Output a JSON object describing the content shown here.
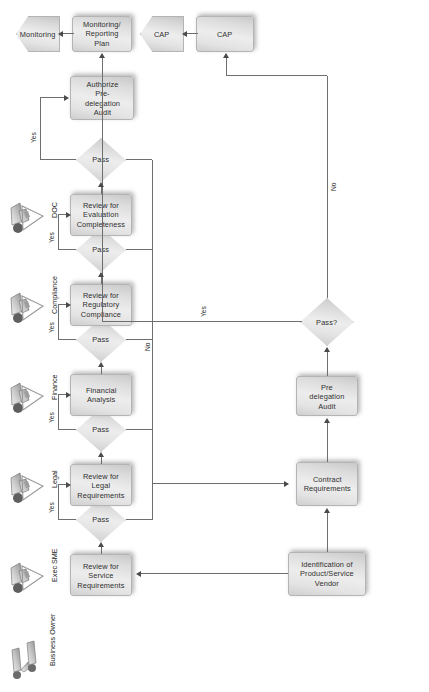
{
  "diagram": {
    "orientation": "rotated-90-ccw",
    "colors": {
      "node_fill": "#e3e3e3",
      "node_border": "#b4b4b4",
      "connector": "#6e6e6e",
      "text": "#2f2f2f",
      "background": "#ffffff"
    }
  },
  "lanes": [
    {
      "id": "business-owner",
      "label": "Business Owner",
      "icon": "two-people-icon"
    },
    {
      "id": "exec-sme",
      "label": "Exec SME",
      "icon": "person-writing-icon"
    },
    {
      "id": "legal",
      "label": "Legal",
      "icon": "person-writing-icon"
    },
    {
      "id": "finance",
      "label": "Finance",
      "icon": "person-writing-icon"
    },
    {
      "id": "compliance",
      "label": "Compliance",
      "icon": "person-writing-icon"
    },
    {
      "id": "doc",
      "label": "DOC",
      "icon": "person-writing-icon"
    }
  ],
  "nodes": [
    {
      "id": "identification",
      "label": "Identification of Product/Service Vendor",
      "shape": "process"
    },
    {
      "id": "contract-req",
      "label": "Contract Requirements",
      "shape": "process"
    },
    {
      "id": "pre-delegation",
      "label": "Pre delegation Audit",
      "shape": "process"
    },
    {
      "id": "pass-final",
      "label": "Pass?",
      "shape": "decision"
    },
    {
      "id": "review-service",
      "label": "Review for Service Requirements",
      "shape": "process"
    },
    {
      "id": "pass-service",
      "label": "Pass",
      "shape": "decision"
    },
    {
      "id": "review-legal",
      "label": "Review for Legal Requirements",
      "shape": "process"
    },
    {
      "id": "pass-legal",
      "label": "Pass",
      "shape": "decision"
    },
    {
      "id": "financial",
      "label": "Financial Analysis",
      "shape": "process"
    },
    {
      "id": "pass-finance",
      "label": "Pass",
      "shape": "decision"
    },
    {
      "id": "review-reg",
      "label": "Review for Regulatory Compliance",
      "shape": "process"
    },
    {
      "id": "pass-reg",
      "label": "Pass",
      "shape": "decision"
    },
    {
      "id": "review-eval",
      "label": "Review for Evaluation Completeness",
      "shape": "process"
    },
    {
      "id": "pass-eval",
      "label": "Pass",
      "shape": "decision"
    },
    {
      "id": "authorize",
      "label": "Authorize Pre-delegation Audit",
      "shape": "process"
    },
    {
      "id": "monitoring-plan",
      "label": "Monitoring/ Reporting Plan",
      "shape": "process"
    },
    {
      "id": "monitoring-end",
      "label": "Monitoring",
      "shape": "terminator"
    },
    {
      "id": "cap-plan",
      "label": "CAP",
      "shape": "process"
    },
    {
      "id": "cap-end",
      "label": "CAP",
      "shape": "terminator"
    }
  ],
  "edge_labels": {
    "yes_service": "Yes",
    "yes_legal": "Yes",
    "yes_finance": "Yes",
    "yes_reg": "Yes",
    "yes_eval": "Yes",
    "no_merge": "No",
    "yes_final": "Yes",
    "no_final": "No"
  }
}
